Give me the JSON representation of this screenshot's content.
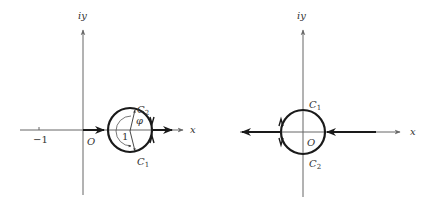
{
  "colors": {
    "axis": "#666666",
    "contour": "#1a1a1a",
    "text": "#333333"
  },
  "left_diagram": {
    "y_axis_label": "iy",
    "x_axis_label": "x",
    "origin_label": "O",
    "tick_label": "−1",
    "curve_upper_label": "C",
    "curve_upper_sub": "2",
    "curve_lower_label": "C",
    "curve_lower_sub": "1",
    "angle_label": "φ",
    "radius_label": "1"
  },
  "right_diagram": {
    "y_axis_label": "iy",
    "x_axis_label": "x",
    "origin_label": "O",
    "curve_upper_label": "C",
    "curve_upper_sub": "1",
    "curve_lower_label": "C",
    "curve_lower_sub": "2"
  }
}
